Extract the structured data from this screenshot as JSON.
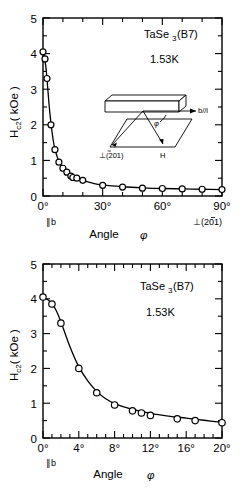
{
  "figure": {
    "panels": [
      {
        "id": "panel-top",
        "sample_label": "TaSe",
        "sample_sub": "3",
        "sample_suffix": "(B7)",
        "temperature": "1.53K",
        "ylabel_main": "H",
        "ylabel_sub": "c2",
        "ylabel_unit": "( kOe )",
        "xlabel_main": "Angle",
        "xlabel_sym": "φ",
        "x_end_left": "∥b",
        "x_end_right": "⊥(̠2̅1)",
        "x_ticks": [
          "0°",
          "30°",
          "60°",
          "90°"
        ],
        "y_ticks": [
          "0",
          "1",
          "2",
          "3",
          "4",
          "5"
        ]
      },
      {
        "id": "panel-bottom",
        "sample_label": "TaSe",
        "sample_sub": "3",
        "sample_suffix": "(B7)",
        "temperature": "1.53K",
        "ylabel_main": "H",
        "ylabel_sub": "c2",
        "ylabel_unit": "( kOe )",
        "xlabel_main": "Angle",
        "xlabel_sym": "φ",
        "x_end_left": "∥b",
        "x_ticks": [
          "0°",
          "4°",
          "8°",
          "12°",
          "16°",
          "20°"
        ],
        "y_ticks": [
          "0",
          "1",
          "2",
          "3",
          "4",
          "5"
        ]
      }
    ],
    "inset": {
      "label_b": "b//i",
      "label_perp": "⊥(201)",
      "label_perp_overbar": "2",
      "label_H": "H",
      "label_phi": "φ"
    }
  },
  "chart_data": [
    {
      "type": "scatter",
      "id": "hc2-vs-angle-full-range",
      "title": "TaSe3(B7)",
      "subtitle": "1.53K",
      "xlabel": "Angle φ",
      "ylabel": "Hc2 (kOe)",
      "xlim": [
        0,
        90
      ],
      "ylim": [
        0,
        5
      ],
      "xtick_values": [
        0,
        30,
        60,
        90
      ],
      "xtick_labels": [
        "0°",
        "30°",
        "60°",
        "90°"
      ],
      "xminor_step": 10,
      "ytick_values": [
        0,
        1,
        2,
        3,
        4,
        5
      ],
      "ytick_labels": [
        "0",
        "1",
        "2",
        "3",
        "4",
        "5"
      ],
      "yminor_step": 0.5,
      "x_axis_endpoint_left": "∥b",
      "x_axis_endpoint_right": "⊥(2̅01)",
      "grid": false,
      "legend": false,
      "marker": "open-circle",
      "x": [
        0,
        1,
        2,
        4,
        6,
        8,
        10,
        12,
        14,
        15,
        17,
        20,
        30,
        40,
        50,
        60,
        70,
        80,
        90
      ],
      "y": [
        4.05,
        3.85,
        3.3,
        2.0,
        1.3,
        0.95,
        0.78,
        0.67,
        0.56,
        0.52,
        0.5,
        0.44,
        0.3,
        0.25,
        0.22,
        0.21,
        0.2,
        0.19,
        0.18
      ],
      "fit_curve": {
        "description": "smooth monotonically decreasing fit through points",
        "x": [
          0,
          0.5,
          1,
          1.5,
          2,
          3,
          4,
          5,
          6,
          8,
          10,
          12,
          15,
          20,
          25,
          30,
          40,
          50,
          60,
          70,
          80,
          90
        ],
        "y": [
          4.05,
          3.95,
          3.8,
          3.6,
          3.3,
          2.6,
          2.05,
          1.62,
          1.32,
          0.97,
          0.79,
          0.68,
          0.55,
          0.44,
          0.36,
          0.31,
          0.26,
          0.23,
          0.21,
          0.2,
          0.19,
          0.18
        ]
      }
    },
    {
      "type": "scatter",
      "id": "hc2-vs-angle-expanded",
      "title": "TaSe3(B7)",
      "subtitle": "1.53K",
      "xlabel": "Angle φ",
      "ylabel": "Hc2 (kOe)",
      "xlim": [
        0,
        20
      ],
      "ylim": [
        0,
        5
      ],
      "xtick_values": [
        0,
        4,
        8,
        12,
        16,
        20
      ],
      "xtick_labels": [
        "0°",
        "4°",
        "8°",
        "12°",
        "16°",
        "20°"
      ],
      "xminor_step": 1,
      "ytick_values": [
        0,
        1,
        2,
        3,
        4,
        5
      ],
      "ytick_labels": [
        "0",
        "1",
        "2",
        "3",
        "4",
        "5"
      ],
      "yminor_step": 0.5,
      "x_axis_endpoint_left": "∥b",
      "grid": false,
      "legend": false,
      "marker": "open-circle",
      "x": [
        0,
        1,
        2,
        4,
        6,
        8,
        10,
        11,
        12,
        15,
        17,
        20
      ],
      "y": [
        4.05,
        3.85,
        3.3,
        2.0,
        1.3,
        0.95,
        0.78,
        0.72,
        0.65,
        0.55,
        0.5,
        0.44
      ],
      "fit_curve": {
        "description": "smooth monotonically decreasing fit through points",
        "x": [
          0,
          0.5,
          1,
          1.5,
          2,
          3,
          4,
          5,
          6,
          7,
          8,
          10,
          12,
          14,
          16,
          18,
          20
        ],
        "y": [
          4.05,
          3.98,
          3.86,
          3.65,
          3.34,
          2.63,
          2.05,
          1.64,
          1.34,
          1.13,
          0.99,
          0.82,
          0.71,
          0.63,
          0.57,
          0.51,
          0.45
        ]
      }
    }
  ]
}
